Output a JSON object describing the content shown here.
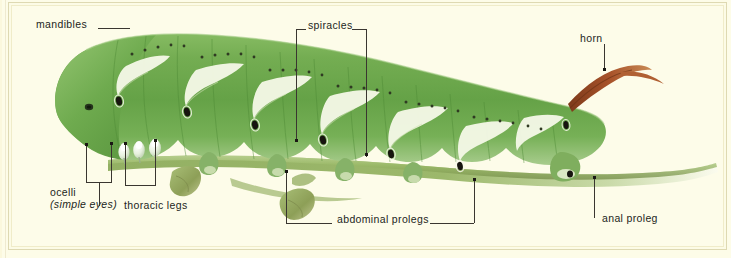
{
  "figure": {
    "background_color": "#fdfce9",
    "frame_color": "#ded9b2",
    "body_color": "#6ba84f",
    "stripe_color": "#f2f6e4",
    "spiracle_color": "#1a1a18",
    "horn_color": "#9c4a22",
    "stem_color": "#8fae5c",
    "leader_color": "#3a3630"
  },
  "labels": {
    "mandibles": "mandibles",
    "spiracles": "spiracles",
    "horn": "horn",
    "ocelli": "ocelli",
    "ocelli_sub": "(simple eyes)",
    "thoracic_legs": "thoracic legs",
    "abdominal_prolegs": "abdominal prolegs",
    "anal_proleg": "anal proleg"
  }
}
